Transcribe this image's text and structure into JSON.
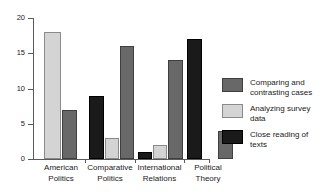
{
  "chart_data": {
    "type": "bar",
    "title": "",
    "xlabel": "",
    "ylabel": "",
    "ylim": [
      0,
      20
    ],
    "yticks": [
      0,
      5,
      10,
      15,
      20
    ],
    "ytick_labels": [
      "0",
      "5",
      "10",
      "15",
      "20"
    ],
    "grid": false,
    "legend_position": "right",
    "categories": [
      "American\nPolitics",
      "Comparative\nPolitics",
      "International\nRelations",
      "Political\nTheory"
    ],
    "series": [
      {
        "name": "Close reading of texts",
        "color": "#1a1a1a",
        "values": [
          0,
          9,
          1,
          17
        ]
      },
      {
        "name": "Analyzing survey data",
        "color": "#d4d4d4",
        "values": [
          18,
          3,
          2,
          0
        ]
      },
      {
        "name": "Comparing and contrasting cases",
        "color": "#686868",
        "values": [
          7,
          16,
          14,
          4
        ]
      }
    ]
  },
  "legend": {
    "entries": [
      {
        "label": "Comparing and\ncontrasting cases",
        "color": "#686868"
      },
      {
        "label": "Analyzing survey data",
        "color": "#d4d4d4"
      },
      {
        "label": "Close reading of texts",
        "color": "#1a1a1a"
      }
    ]
  },
  "axis": {
    "y_labels": [
      "20",
      "15",
      "10",
      "5",
      "0"
    ]
  }
}
